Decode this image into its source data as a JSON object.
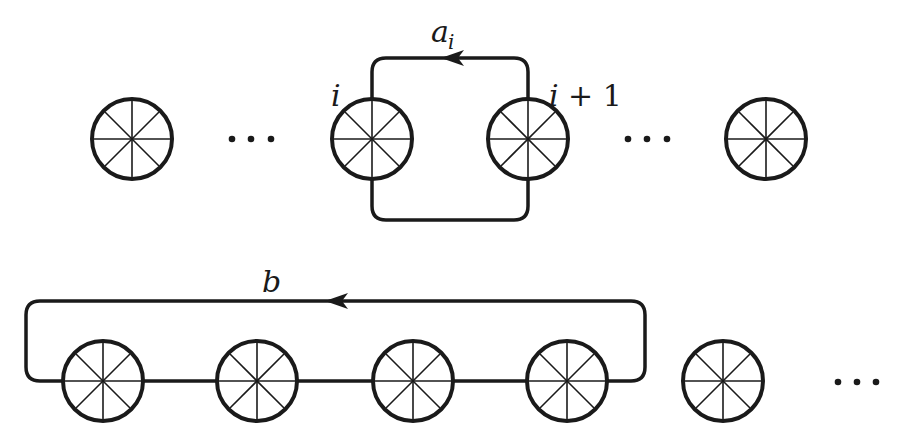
{
  "diagram": {
    "type": "loop-diagram",
    "colors": {
      "stroke": "#1a1a1a",
      "background": "#ffffff"
    },
    "top_row": {
      "nodes": [
        {
          "id": "top-1",
          "cx": 132,
          "cy": 139,
          "label": ""
        },
        {
          "id": "top-i",
          "cx": 372,
          "cy": 139,
          "label": "i"
        },
        {
          "id": "top-i+1",
          "cx": 528,
          "cy": 139,
          "label": "i + 1"
        },
        {
          "id": "top-last",
          "cx": 766,
          "cy": 139,
          "label": ""
        }
      ],
      "ellipses": [
        {
          "x": 251,
          "y": 139,
          "text": "···"
        },
        {
          "x": 647,
          "y": 139,
          "text": "···"
        }
      ],
      "loop": {
        "label": "a",
        "subscript": "i",
        "direction": "left",
        "from": "i+1",
        "to": "i"
      }
    },
    "bottom_row": {
      "nodes": [
        {
          "id": "bottom-1",
          "cx": 103,
          "cy": 381
        },
        {
          "id": "bottom-2",
          "cx": 257,
          "cy": 381
        },
        {
          "id": "bottom-3",
          "cx": 413,
          "cy": 381
        },
        {
          "id": "bottom-4",
          "cx": 567,
          "cy": 381
        },
        {
          "id": "bottom-5",
          "cx": 723,
          "cy": 381
        }
      ],
      "ellipses": [
        {
          "x": 855,
          "y": 381,
          "text": "···"
        }
      ],
      "loop": {
        "label": "b",
        "direction": "left",
        "encloses": [
          "bottom-1",
          "bottom-2",
          "bottom-3",
          "bottom-4"
        ]
      }
    },
    "labels": {
      "node_i": "i",
      "node_i_plus_1_var": "i",
      "node_i_plus_1_rest": "+ 1",
      "loop_a": "a",
      "loop_a_sub": "i",
      "loop_b": "b",
      "dots": "···"
    }
  }
}
